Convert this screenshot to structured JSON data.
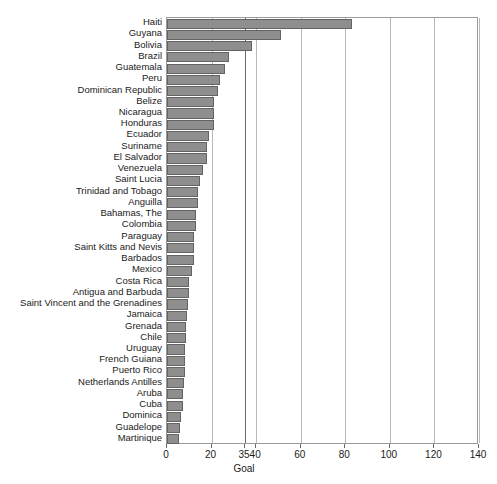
{
  "chart_data": {
    "type": "bar",
    "orientation": "horizontal",
    "title": "",
    "xlabel": "Goal",
    "ylabel": "",
    "xlim": [
      0,
      140
    ],
    "ylim": null,
    "grid": true,
    "legend": null,
    "xticks": [
      0,
      20,
      35,
      40,
      60,
      80,
      100,
      120,
      140
    ],
    "xtick_labels": [
      "0",
      "20",
      "35",
      "40",
      "60",
      "80",
      "100",
      "120",
      "140"
    ],
    "goal_line": 35,
    "bar_color": "#8e8e8e",
    "bar_edge_color": "#636363",
    "grid_color": "#b8b8b8",
    "frame_color": "#9a9a9a",
    "categories": [
      "Haiti",
      "Guyana",
      "Bolivia",
      "Brazil",
      "Guatemala",
      "Peru",
      "Dominican Republic",
      "Belize",
      "Nicaragua",
      "Honduras",
      "Ecuador",
      "Suriname",
      "El Salvador",
      "Venezuela",
      "Saint Lucia",
      "Trinidad and Tobago",
      "Anguilla",
      "Bahamas, The",
      "Colombia",
      "Paraguay",
      "Saint Kitts and Nevis",
      "Barbados",
      "Mexico",
      "Costa Rica",
      "Antigua and Barbuda",
      "Saint Vincent and the Grenadines",
      "Jamaica",
      "Grenada",
      "Chile",
      "Uruguay",
      "French Guiana",
      "Puerto Rico",
      "Netherlands Antilles",
      "Aruba",
      "Cuba",
      "Dominica",
      "Guadelope",
      "Martinique"
    ],
    "values": [
      83,
      51,
      38,
      28,
      26,
      24,
      23,
      21,
      21,
      21,
      19,
      18,
      18,
      16,
      15,
      14,
      14,
      13,
      13,
      12,
      12,
      12,
      11,
      10,
      10,
      9.5,
      9,
      8.5,
      8.5,
      8,
      8,
      8,
      7.5,
      7,
      7,
      6.5,
      6,
      5.5
    ]
  }
}
